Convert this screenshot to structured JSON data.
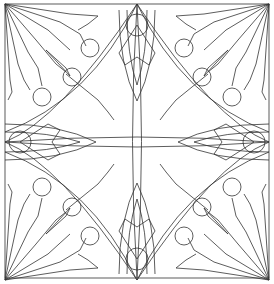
{
  "artwork": {
    "title": "",
    "kind": "symmetric mandala line-art coloring pattern",
    "symmetry": "4-fold mirror",
    "stroke_color": "#333333",
    "background_color": "#ffffff",
    "frame": {
      "x": 5,
      "y": 4,
      "width": 264,
      "height": 274
    }
  }
}
